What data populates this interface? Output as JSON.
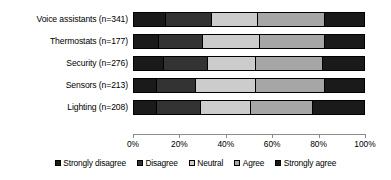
{
  "chart_data": {
    "type": "bar",
    "subtype": "stacked-horizontal-likert",
    "title": "",
    "xlabel": "",
    "ylabel": "",
    "xlim": [
      0,
      100
    ],
    "xticks": [
      "0%",
      "20%",
      "40%",
      "60%",
      "80%",
      "100%"
    ],
    "grid": false,
    "legend_position": "bottom",
    "stacked_total": 100,
    "categories": [
      "Voice assistants (n=341)",
      "Thermostats (n=177)",
      "Security (n=276)",
      "Sensors (n=213)",
      "Lighting (n=208)"
    ],
    "series": [
      {
        "name": "Strongly disagree",
        "color": "#1a1a1a",
        "values": [
          14,
          11,
          13,
          10,
          10
        ]
      },
      {
        "name": "Disagree",
        "color": "#333333",
        "values": [
          20,
          19,
          19,
          17,
          19
        ]
      },
      {
        "name": "Neutral",
        "color": "#cccccc",
        "values": [
          20,
          25,
          21,
          26,
          22
        ]
      },
      {
        "name": "Agree",
        "color": "#a6a6a6",
        "values": [
          29,
          28,
          29,
          30,
          27
        ]
      },
      {
        "name": "Strongly agree",
        "color": "#1a1a1a",
        "values": [
          17,
          17,
          18,
          17,
          22
        ]
      }
    ]
  },
  "legend": {
    "items": [
      {
        "label": "Strongly disagree",
        "color": "#1a1a1a"
      },
      {
        "label": "Disagree",
        "color": "#333333"
      },
      {
        "label": "Neutral",
        "color": "#cccccc"
      },
      {
        "label": "Agree",
        "color": "#a6a6a6"
      },
      {
        "label": "Strongly agree",
        "color": "#1a1a1a"
      }
    ]
  }
}
